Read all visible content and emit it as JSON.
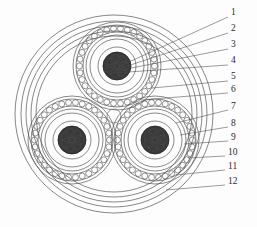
{
  "figure": {
    "kind": "cable-cross-section-diagram",
    "background_color": "#fdfdfd",
    "line_color": "#4a4a4a",
    "conductor_fill": "#3a3a3a",
    "callout_count": 12
  },
  "callouts": [
    {
      "id": 1,
      "label": "1",
      "x": 231,
      "y": 13,
      "line": {
        "x1": 228,
        "y1": 17,
        "x2": 120,
        "y2": 66
      }
    },
    {
      "id": 2,
      "label": "2",
      "x": 231,
      "y": 29,
      "line": {
        "x1": 228,
        "y1": 33,
        "x2": 118,
        "y2": 69
      }
    },
    {
      "id": 3,
      "label": "3",
      "x": 231,
      "y": 45,
      "line": {
        "x1": 228,
        "y1": 49,
        "x2": 116,
        "y2": 71
      }
    },
    {
      "id": 4,
      "label": "4",
      "x": 231,
      "y": 61,
      "line": {
        "x1": 228,
        "y1": 65,
        "x2": 114,
        "y2": 73
      }
    },
    {
      "id": 5,
      "label": "5",
      "x": 231,
      "y": 77,
      "line": {
        "x1": 228,
        "y1": 81,
        "x2": 152,
        "y2": 88
      }
    },
    {
      "id": 6,
      "label": "6",
      "x": 231,
      "y": 90,
      "line": {
        "x1": 228,
        "y1": 93,
        "x2": 141,
        "y2": 100
      }
    },
    {
      "id": 7,
      "label": "7",
      "x": 231,
      "y": 107,
      "line": {
        "x1": 228,
        "y1": 110,
        "x2": 176,
        "y2": 123
      }
    },
    {
      "id": 8,
      "label": "8",
      "x": 231,
      "y": 124,
      "line": {
        "x1": 228,
        "y1": 127,
        "x2": 180,
        "y2": 135
      }
    },
    {
      "id": 9,
      "label": "9",
      "x": 231,
      "y": 138,
      "line": {
        "x1": 228,
        "y1": 141,
        "x2": 184,
        "y2": 144
      }
    },
    {
      "id": 10,
      "label": "10",
      "x": 228,
      "y": 153,
      "line": {
        "x1": 225,
        "y1": 156,
        "x2": 188,
        "y2": 158
      }
    },
    {
      "id": 11,
      "label": "11",
      "x": 228,
      "y": 167,
      "line": {
        "x1": 225,
        "y1": 170,
        "x2": 176,
        "y2": 175
      }
    },
    {
      "id": 12,
      "label": "12",
      "x": 228,
      "y": 182,
      "line": {
        "x1": 225,
        "y1": 185,
        "x2": 166,
        "y2": 190
      }
    }
  ],
  "outer_rings": [
    {
      "name": "outer-sheath-outer-edge",
      "rx": 99,
      "ry": 99
    },
    {
      "name": "outer-sheath-inner-edge",
      "rx": 93,
      "ry": 93
    },
    {
      "name": "bedding-outer-edge",
      "rx": 88,
      "ry": 88
    },
    {
      "name": "bedding-inner-edge",
      "rx": 83,
      "ry": 83
    },
    {
      "name": "armour-boundary",
      "rx": 78,
      "ry": 78
    }
  ],
  "cores": [
    {
      "name": "core-top",
      "cx": 117,
      "cy": 66
    },
    {
      "name": "core-bottom-left",
      "cx": 72,
      "cy": 140
    },
    {
      "name": "core-bottom-right",
      "cx": 155,
      "cy": 140
    }
  ],
  "core_layers": [
    {
      "name": "conductor",
      "r": 14,
      "fill": "#3a3a3a"
    },
    {
      "name": "conductor-screen",
      "r": 19,
      "fill": "none"
    },
    {
      "name": "insulation",
      "r": 27,
      "fill": "none"
    },
    {
      "name": "insulation-screen",
      "r": 31,
      "fill": "none"
    },
    {
      "name": "wire-screen-inner",
      "r": 34,
      "fill": "none"
    },
    {
      "name": "wire-screen-outer",
      "r": 41,
      "fill": "none"
    },
    {
      "name": "core-sheath",
      "r": 44,
      "fill": "none"
    }
  ],
  "wire_screen": {
    "bead_count": 34,
    "bead_radius": 3.0,
    "ring_radius": 37.5
  },
  "filler": {
    "name": "central-filler",
    "cx": 114,
    "cy": 116,
    "r": 7
  },
  "center": {
    "cx": 114,
    "cy": 114
  }
}
